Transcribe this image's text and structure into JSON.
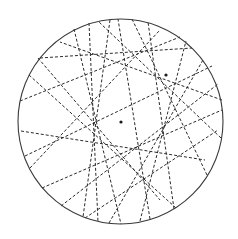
{
  "figure": {
    "width": 238,
    "height": 239,
    "circle": {
      "cx": 120.5,
      "cy": 121.5,
      "r": 102.5
    },
    "colors": {
      "boundary": "#3a3a3a",
      "chord": "#2a2a2a",
      "focus": "#1a1a1a",
      "background": "#ffffff"
    },
    "foci": [
      {
        "x": 166,
        "y": 75
      },
      {
        "x": 121,
        "y": 122
      }
    ],
    "chords": [
      {
        "x1": 40,
        "y1": 58,
        "x2": 192,
        "y2": 48
      },
      {
        "x1": 20,
        "y1": 101,
        "x2": 180,
        "y2": 37
      },
      {
        "x1": 29,
        "y1": 75,
        "x2": 176,
        "y2": 208
      },
      {
        "x1": 74,
        "y1": 29,
        "x2": 121,
        "y2": 224
      },
      {
        "x1": 89,
        "y1": 23,
        "x2": 98,
        "y2": 222
      },
      {
        "x1": 110,
        "y1": 20,
        "x2": 83,
        "y2": 217
      },
      {
        "x1": 21,
        "y1": 131,
        "x2": 205,
        "y2": 160
      },
      {
        "x1": 25,
        "y1": 156,
        "x2": 212,
        "y2": 66
      },
      {
        "x1": 42,
        "y1": 188,
        "x2": 222,
        "y2": 110
      },
      {
        "x1": 61,
        "y1": 206,
        "x2": 218,
        "y2": 84
      },
      {
        "x1": 109,
        "y1": 223,
        "x2": 203,
        "y2": 60
      },
      {
        "x1": 140,
        "y1": 221,
        "x2": 186,
        "y2": 41
      },
      {
        "x1": 174,
        "y1": 209,
        "x2": 148,
        "y2": 22
      },
      {
        "x1": 207,
        "y1": 175,
        "x2": 132,
        "y2": 19
      },
      {
        "x1": 222,
        "y1": 100,
        "x2": 60,
        "y2": 42
      },
      {
        "x1": 221,
        "y1": 138,
        "x2": 99,
        "y2": 22
      },
      {
        "x1": 38,
        "y1": 58,
        "x2": 160,
        "y2": 200
      },
      {
        "x1": 30,
        "y1": 168,
        "x2": 160,
        "y2": 30
      },
      {
        "x1": 85,
        "y1": 218,
        "x2": 218,
        "y2": 130
      },
      {
        "x1": 150,
        "y1": 219,
        "x2": 118,
        "y2": 19
      }
    ]
  }
}
